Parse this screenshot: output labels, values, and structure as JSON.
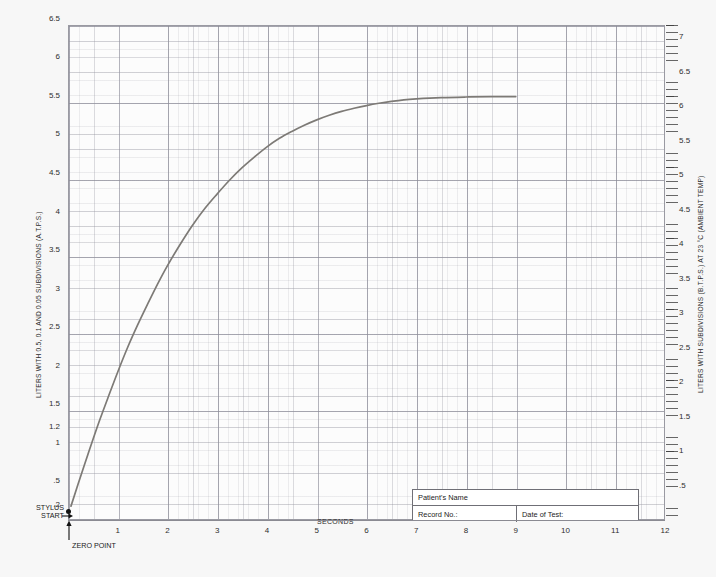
{
  "chart_data": {
    "type": "line",
    "title": "",
    "xlabel": "SECONDS",
    "ylabel": "LITERS WITH 0.5, 0.1 AND 0.05 SUBDIVISIONS (A.T.P.S.)",
    "ylabel_right": "LITERS WITH SUBDIVISIONS (B.T.P.S.) AT 23 °C (AMBIENT TEMP)",
    "xlim": [
      0,
      12
    ],
    "ylim": [
      0,
      6.9
    ],
    "ylim_right": [
      0,
      7.4
    ],
    "grid": true,
    "legend": null,
    "x_ticks": [
      1,
      2,
      3,
      4,
      5,
      6,
      7,
      8,
      9,
      10,
      11,
      12
    ],
    "x_tick_labels": [
      "1",
      "2",
      "3",
      "4",
      "5",
      "6",
      "7",
      "8",
      "9",
      "10",
      "11",
      "12"
    ],
    "y_ticks_left": [
      0.2,
      0.5,
      1,
      1.2,
      1.5,
      2,
      2.5,
      3,
      3.5,
      4,
      4.5,
      5,
      5.5,
      6,
      6.5
    ],
    "y_tick_labels_left": [
      ".2",
      ".5",
      "1",
      "1.2",
      "1.5",
      "2",
      "2.5",
      "3",
      "3.5",
      "4",
      "4.5",
      "5",
      "5.5",
      "6",
      "6.5"
    ],
    "y_ticks_right": [
      0.5,
      1,
      1.5,
      2,
      2.5,
      3,
      3.5,
      4,
      4.5,
      5,
      5.5,
      6,
      6.5,
      7
    ],
    "y_tick_labels_right": [
      ".5",
      "1",
      "1.5",
      "2",
      "2.5",
      "3",
      "3.5",
      "4",
      "4.5",
      "5",
      "5.5",
      "6",
      "6.5",
      "7"
    ],
    "series": [
      {
        "name": "spirogram",
        "color": "#7d7a76",
        "linewidth": 1.7,
        "x": [
          0.06,
          0.2,
          0.4,
          0.6,
          0.8,
          1.0,
          1.2,
          1.4,
          1.6,
          1.8,
          2.0,
          2.25,
          2.5,
          2.75,
          3.0,
          3.25,
          3.5,
          3.75,
          4.0,
          4.25,
          4.5,
          4.75,
          5.0,
          5.25,
          5.5,
          5.75,
          6.0,
          6.25,
          6.5,
          6.75,
          7.0,
          7.5,
          8.0,
          8.5,
          9.0
        ],
        "y": [
          0.18,
          0.46,
          0.85,
          1.23,
          1.58,
          1.92,
          2.24,
          2.53,
          2.8,
          3.06,
          3.3,
          3.57,
          3.82,
          4.04,
          4.23,
          4.41,
          4.57,
          4.71,
          4.84,
          4.95,
          5.04,
          5.12,
          5.19,
          5.25,
          5.3,
          5.34,
          5.375,
          5.405,
          5.43,
          5.45,
          5.462,
          5.478,
          5.486,
          5.49,
          5.492
        ]
      }
    ],
    "annotations": {
      "stylus_start": "STYLUS\nSTART",
      "stylus_start_line1": "STYLUS",
      "stylus_start_line2": "START",
      "zero_point": "ZERO POINT",
      "seconds": "SECONDS"
    }
  },
  "form": {
    "patient_name_label": "Patient's Name",
    "record_no_label": "Record No.:",
    "date_of_test_label": "Date of Test:"
  },
  "colors": {
    "sheet_background": "#f7f7f7",
    "plot_background": "#fcfcfc",
    "grid_major": "#78788a",
    "grid_minor": "#9696a0",
    "curve": "#7d7a76",
    "border": "#9a9aa2",
    "text": "#2b2b2b"
  }
}
